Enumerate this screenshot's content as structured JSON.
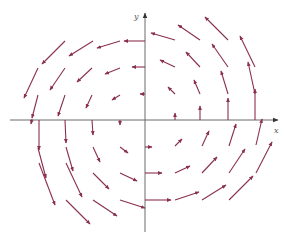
{
  "diagram": {
    "type": "vector-field",
    "colors": {
      "axis": "#6a6a6a",
      "vector": "#8a2f52",
      "background": "#ffffff"
    },
    "axes": {
      "x_label": "x",
      "y_label": "y",
      "origin_px": [
        145,
        120
      ],
      "x_axis_px": [
        10,
        278
      ],
      "y_axis_px": [
        232,
        13
      ]
    },
    "vectors": [
      {
        "from": [
          65,
          41
        ],
        "to": [
          42,
          64
        ]
      },
      {
        "from": [
          93,
          41
        ],
        "to": [
          69,
          56
        ]
      },
      {
        "from": [
          120,
          41
        ],
        "to": [
          97,
          48
        ]
      },
      {
        "from": [
          145,
          41
        ],
        "to": [
          124,
          41
        ]
      },
      {
        "from": [
          38,
          68
        ],
        "to": [
          24,
          98
        ]
      },
      {
        "from": [
          65,
          68
        ],
        "to": [
          50,
          90
        ]
      },
      {
        "from": [
          92,
          68
        ],
        "to": [
          77,
          82
        ]
      },
      {
        "from": [
          120,
          68
        ],
        "to": [
          105,
          74
        ]
      },
      {
        "from": [
          145,
          67
        ],
        "to": [
          132,
          67
        ]
      },
      {
        "from": [
          38,
          95
        ],
        "to": [
          32,
          118
        ]
      },
      {
        "from": [
          65,
          95
        ],
        "to": [
          58,
          116
        ]
      },
      {
        "from": [
          92,
          95
        ],
        "to": [
          86,
          108
        ]
      },
      {
        "from": [
          120,
          95
        ],
        "to": [
          112,
          100
        ]
      },
      {
        "from": [
          145,
          94
        ],
        "to": [
          140,
          94
        ]
      },
      {
        "from": [
          175,
          40
        ],
        "to": [
          151,
          33
        ]
      },
      {
        "from": [
          200,
          40
        ],
        "to": [
          178,
          25
        ]
      },
      {
        "from": [
          228,
          40
        ],
        "to": [
          205,
          17
        ]
      },
      {
        "from": [
          175,
          67
        ],
        "to": [
          160,
          60
        ]
      },
      {
        "from": [
          200,
          67
        ],
        "to": [
          186,
          52
        ]
      },
      {
        "from": [
          228,
          67
        ],
        "to": [
          212,
          44
        ]
      },
      {
        "from": [
          255,
          67
        ],
        "to": [
          240,
          36
        ]
      },
      {
        "from": [
          175,
          94
        ],
        "to": [
          168,
          87
        ]
      },
      {
        "from": [
          200,
          94
        ],
        "to": [
          194,
          80
        ]
      },
      {
        "from": [
          228,
          94
        ],
        "to": [
          221,
          71
        ]
      },
      {
        "from": [
          255,
          94
        ],
        "to": [
          248,
          62
        ]
      },
      {
        "from": [
          175,
          120
        ],
        "to": [
          175,
          113
        ]
      },
      {
        "from": [
          200,
          120
        ],
        "to": [
          200,
          106
        ]
      },
      {
        "from": [
          228,
          120
        ],
        "to": [
          228,
          98
        ]
      },
      {
        "from": [
          255,
          120
        ],
        "to": [
          255,
          89
        ]
      },
      {
        "from": [
          32,
          119
        ],
        "to": [
          31,
          124
        ]
      },
      {
        "from": [
          39,
          120
        ],
        "to": [
          39,
          150
        ]
      },
      {
        "from": [
          65,
          120
        ],
        "to": [
          66,
          143
        ]
      },
      {
        "from": [
          92,
          120
        ],
        "to": [
          93,
          135
        ]
      },
      {
        "from": [
          120,
          120
        ],
        "to": [
          120,
          125
        ]
      },
      {
        "from": [
          38,
          148
        ],
        "to": [
          46,
          178
        ]
      },
      {
        "from": [
          66,
          147
        ],
        "to": [
          73,
          171
        ]
      },
      {
        "from": [
          93,
          147
        ],
        "to": [
          100,
          162
        ]
      },
      {
        "from": [
          120,
          147
        ],
        "to": [
          128,
          153
        ]
      },
      {
        "from": [
          39,
          163
        ],
        "to": [
          55,
          205
        ]
      },
      {
        "from": [
          66,
          163
        ],
        "to": [
          82,
          197
        ]
      },
      {
        "from": [
          93,
          173
        ],
        "to": [
          109,
          189
        ]
      },
      {
        "from": [
          120,
          173
        ],
        "to": [
          137,
          181
        ]
      },
      {
        "from": [
          66,
          200
        ],
        "to": [
          90,
          224
        ]
      },
      {
        "from": [
          93,
          200
        ],
        "to": [
          117,
          216
        ]
      },
      {
        "from": [
          120,
          200
        ],
        "to": [
          145,
          208
        ]
      },
      {
        "from": [
          145,
          147
        ],
        "to": [
          152,
          147
        ]
      },
      {
        "from": [
          175,
          146
        ],
        "to": [
          182,
          139
        ]
      },
      {
        "from": [
          202,
          146
        ],
        "to": [
          209,
          131
        ]
      },
      {
        "from": [
          229,
          146
        ],
        "to": [
          236,
          124
        ]
      },
      {
        "from": [
          256,
          145
        ],
        "to": [
          262,
          119
        ]
      },
      {
        "from": [
          145,
          173
        ],
        "to": [
          162,
          173
        ]
      },
      {
        "from": [
          175,
          173
        ],
        "to": [
          190,
          166
        ]
      },
      {
        "from": [
          202,
          173
        ],
        "to": [
          217,
          157
        ]
      },
      {
        "from": [
          229,
          173
        ],
        "to": [
          245,
          149
        ]
      },
      {
        "from": [
          256,
          173
        ],
        "to": [
          272,
          142
        ]
      },
      {
        "from": [
          145,
          200
        ],
        "to": [
          171,
          200
        ]
      },
      {
        "from": [
          175,
          200
        ],
        "to": [
          199,
          192
        ]
      },
      {
        "from": [
          202,
          200
        ],
        "to": [
          226,
          185
        ]
      },
      {
        "from": [
          229,
          200
        ],
        "to": [
          253,
          176
        ]
      }
    ]
  }
}
